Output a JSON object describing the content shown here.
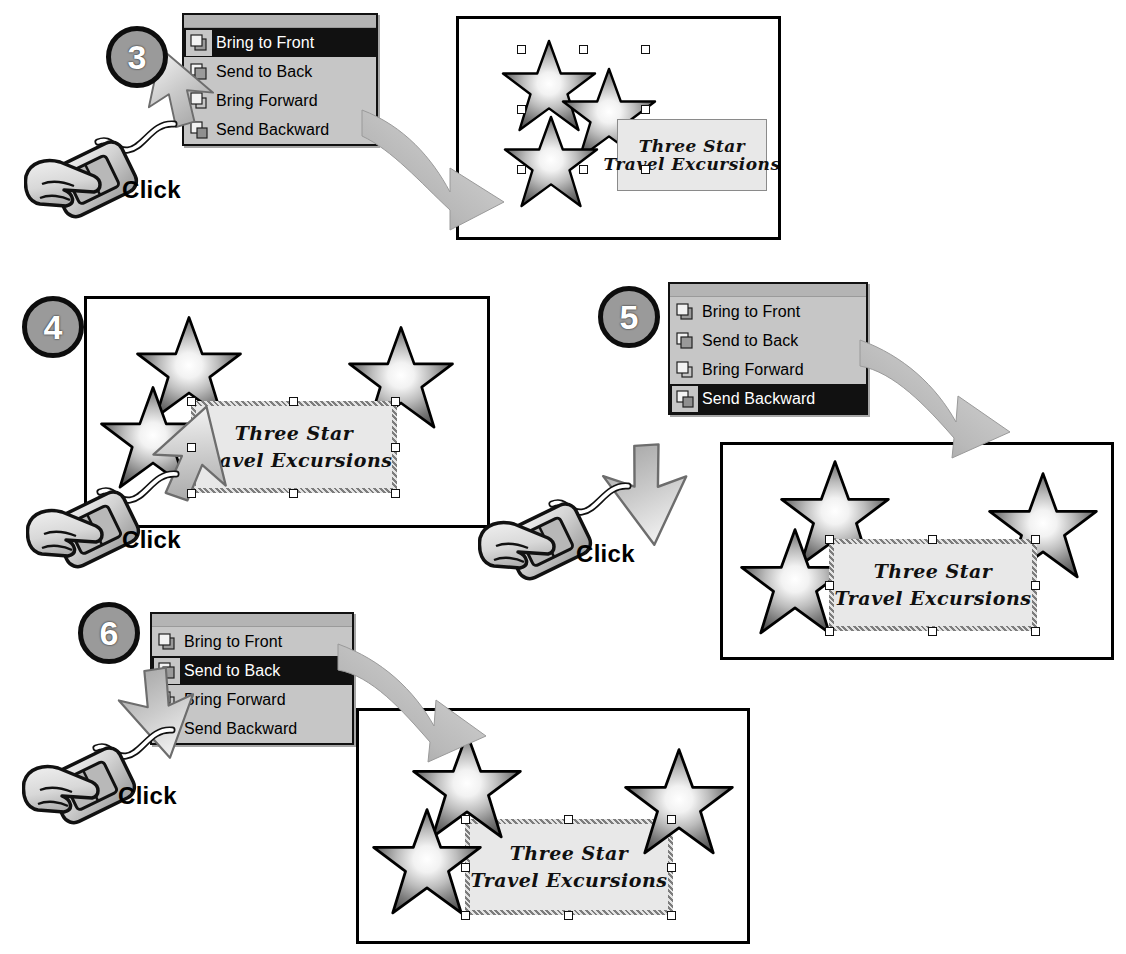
{
  "document": {
    "title": "Changing the stacking order of objects",
    "text_box_line1": "Three Star",
    "text_box_line2": "Travel Excursions"
  },
  "menu": {
    "items": [
      {
        "label": "Bring to Front",
        "accel": "t",
        "icon": "bring-to-front-icon"
      },
      {
        "label": "Send to Back",
        "accel": "k",
        "icon": "send-to-back-icon"
      },
      {
        "label": "Bring Forward",
        "accel": "F",
        "icon": "bring-forward-icon"
      },
      {
        "label": "Send Backward",
        "accel": "B",
        "icon": "send-backward-icon"
      }
    ]
  },
  "steps": [
    {
      "number": "3",
      "click_label": "Click",
      "selected_menu_item": "Bring to Front",
      "result_caption": "Stars brought to front, text box behind"
    },
    {
      "number": "4",
      "click_label": "Click",
      "selected_menu_item": "",
      "result_caption": "Text box selected in front of stars"
    },
    {
      "number": "5",
      "click_label": "Click",
      "selected_menu_item": "Send Backward",
      "result_caption": "Text box sent backward one level"
    },
    {
      "number": "6",
      "click_label": "Click",
      "selected_menu_item": "Send to Back",
      "result_caption": "Text box sent to back behind all stars"
    }
  ],
  "colors": {
    "menu_background": "#c6c6c6",
    "menu_highlight": "#111111",
    "menu_highlight_text": "#ffffff",
    "badge_fill": "#9a9a9a",
    "badge_ring": "#0d0d0d",
    "badge_text": "#ffffff",
    "slide_border": "#000000",
    "text_box_fill": "#e8e8e8",
    "arrow_gray": "#b5b5b5",
    "star_outline": "#000000",
    "page_background": "#ffffff"
  }
}
